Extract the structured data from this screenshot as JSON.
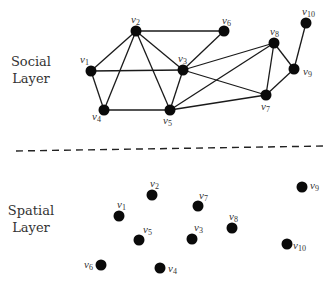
{
  "social_layer": {
    "label_line1": "Social",
    "label_line2": "Layer",
    "nodes": [
      {
        "id": "v1",
        "name": "v",
        "sub": "1",
        "x": 91,
        "y": 71,
        "lx": 80,
        "ly": 63
      },
      {
        "id": "v2",
        "name": "v",
        "sub": "2",
        "x": 136,
        "y": 31,
        "lx": 131,
        "ly": 23
      },
      {
        "id": "v3",
        "name": "v",
        "sub": "3",
        "x": 183,
        "y": 70,
        "lx": 178,
        "ly": 62
      },
      {
        "id": "v4",
        "name": "v",
        "sub": "4",
        "x": 104,
        "y": 110,
        "lx": 92,
        "ly": 120
      },
      {
        "id": "v5",
        "name": "v",
        "sub": "5",
        "x": 170,
        "y": 110,
        "lx": 163,
        "ly": 124
      },
      {
        "id": "v6",
        "name": "v",
        "sub": "6",
        "x": 224,
        "y": 31,
        "lx": 222,
        "ly": 24
      },
      {
        "id": "v7",
        "name": "v",
        "sub": "7",
        "x": 266,
        "y": 95,
        "lx": 261,
        "ly": 110
      },
      {
        "id": "v8",
        "name": "v",
        "sub": "8",
        "x": 274,
        "y": 43,
        "lx": 270,
        "ly": 35
      },
      {
        "id": "v9",
        "name": "v",
        "sub": "9",
        "x": 294,
        "y": 69,
        "lx": 303,
        "ly": 75
      },
      {
        "id": "v10",
        "name": "v",
        "sub": "10",
        "x": 306,
        "y": 23,
        "lx": 302,
        "ly": 15
      }
    ],
    "edges": [
      [
        "v1",
        "v2"
      ],
      [
        "v1",
        "v3"
      ],
      [
        "v1",
        "v4"
      ],
      [
        "v2",
        "v4"
      ],
      [
        "v2",
        "v5"
      ],
      [
        "v2",
        "v3"
      ],
      [
        "v2",
        "v6"
      ],
      [
        "v3",
        "v6"
      ],
      [
        "v3",
        "v5"
      ],
      [
        "v4",
        "v5"
      ],
      [
        "v3",
        "v8"
      ],
      [
        "v3",
        "v7"
      ],
      [
        "v5",
        "v8"
      ],
      [
        "v5",
        "v7"
      ],
      [
        "v8",
        "v7"
      ],
      [
        "v8",
        "v9"
      ],
      [
        "v9",
        "v7"
      ],
      [
        "v9",
        "v10"
      ]
    ]
  },
  "divider": {
    "x1": 16,
    "y1": 151,
    "x2": 326,
    "y2": 146,
    "style": "dashed"
  },
  "spatial_layer": {
    "label_line1": "Spatial",
    "label_line2": "Layer",
    "nodes": [
      {
        "id": "v1",
        "name": "v",
        "sub": "1",
        "x": 119,
        "y": 216,
        "lx": 117,
        "ly": 208
      },
      {
        "id": "v2",
        "name": "v",
        "sub": "2",
        "x": 152,
        "y": 195,
        "lx": 150,
        "ly": 187
      },
      {
        "id": "v3",
        "name": "v",
        "sub": "3",
        "x": 192,
        "y": 239,
        "lx": 194,
        "ly": 231
      },
      {
        "id": "v4",
        "name": "v",
        "sub": "4",
        "x": 160,
        "y": 268,
        "lx": 168,
        "ly": 272
      },
      {
        "id": "v5",
        "name": "v",
        "sub": "5",
        "x": 139,
        "y": 240,
        "lx": 143,
        "ly": 233
      },
      {
        "id": "v6",
        "name": "v",
        "sub": "6",
        "x": 101,
        "y": 265,
        "lx": 84,
        "ly": 268
      },
      {
        "id": "v7",
        "name": "v",
        "sub": "7",
        "x": 198,
        "y": 206,
        "lx": 199,
        "ly": 199
      },
      {
        "id": "v8",
        "name": "v",
        "sub": "8",
        "x": 232,
        "y": 228,
        "lx": 229,
        "ly": 220
      },
      {
        "id": "v9",
        "name": "v",
        "sub": "9",
        "x": 302,
        "y": 187,
        "lx": 310,
        "ly": 189
      },
      {
        "id": "v10",
        "name": "v",
        "sub": "10",
        "x": 287,
        "y": 244,
        "lx": 293,
        "ly": 249
      }
    ]
  },
  "colors": {
    "node": "#0a0a0a",
    "edge": "#1a1a1a",
    "text": "#333333",
    "background": "#ffffff"
  }
}
